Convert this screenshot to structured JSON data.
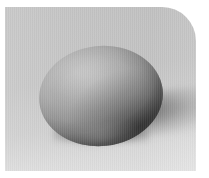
{
  "image": {
    "subject": "egg",
    "scene_description": "A single smooth-shelled egg resting on a plain gray studio backdrop, lit from the upper left, casting a soft shadow to the lower right.",
    "palette": {
      "page_background": "#ffffff",
      "backdrop_light": "#e4e4e4",
      "backdrop_mid": "#cfcfcf",
      "backdrop_dark": "#c3c3c3",
      "egg_highlight": "#bdbdbd",
      "egg_midtone": "#a8a8a8",
      "egg_shadow": "#5f5f5f",
      "egg_terminator": "#4c4c4c",
      "cast_shadow": "#5a5a5a",
      "contact_shadow": "#2f2f2f"
    },
    "plate": {
      "corner_radius_top_right": "34px",
      "margin_left": "5px",
      "margin_top": "7px",
      "width": "191px",
      "height": "164px"
    },
    "lighting": {
      "key_light_direction": "upper-left",
      "shadow_direction": "lower-right"
    },
    "labels": {
      "egg": "egg",
      "cast_shadow": "cast shadow",
      "contact_shadow": "contact shadow",
      "backdrop": "gray backdrop"
    }
  }
}
